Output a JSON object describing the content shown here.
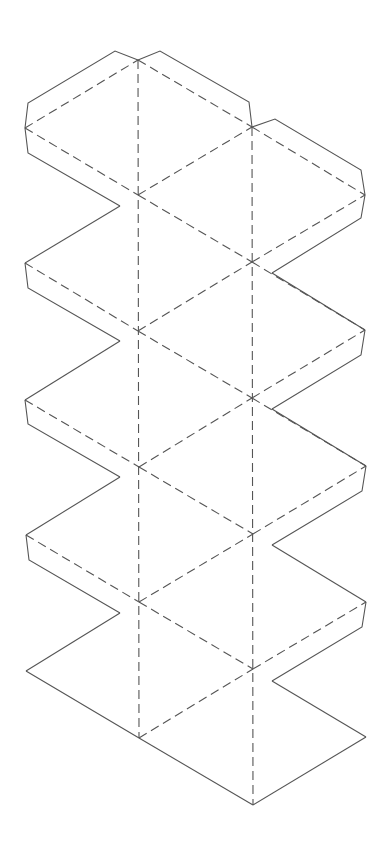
{
  "diagram": {
    "type": "icosahedron-net",
    "faces": 20,
    "line_color": "#555555",
    "background": "#ffffff",
    "legend": {
      "cut_lines": "solid",
      "fold_lines": "dashed"
    }
  }
}
